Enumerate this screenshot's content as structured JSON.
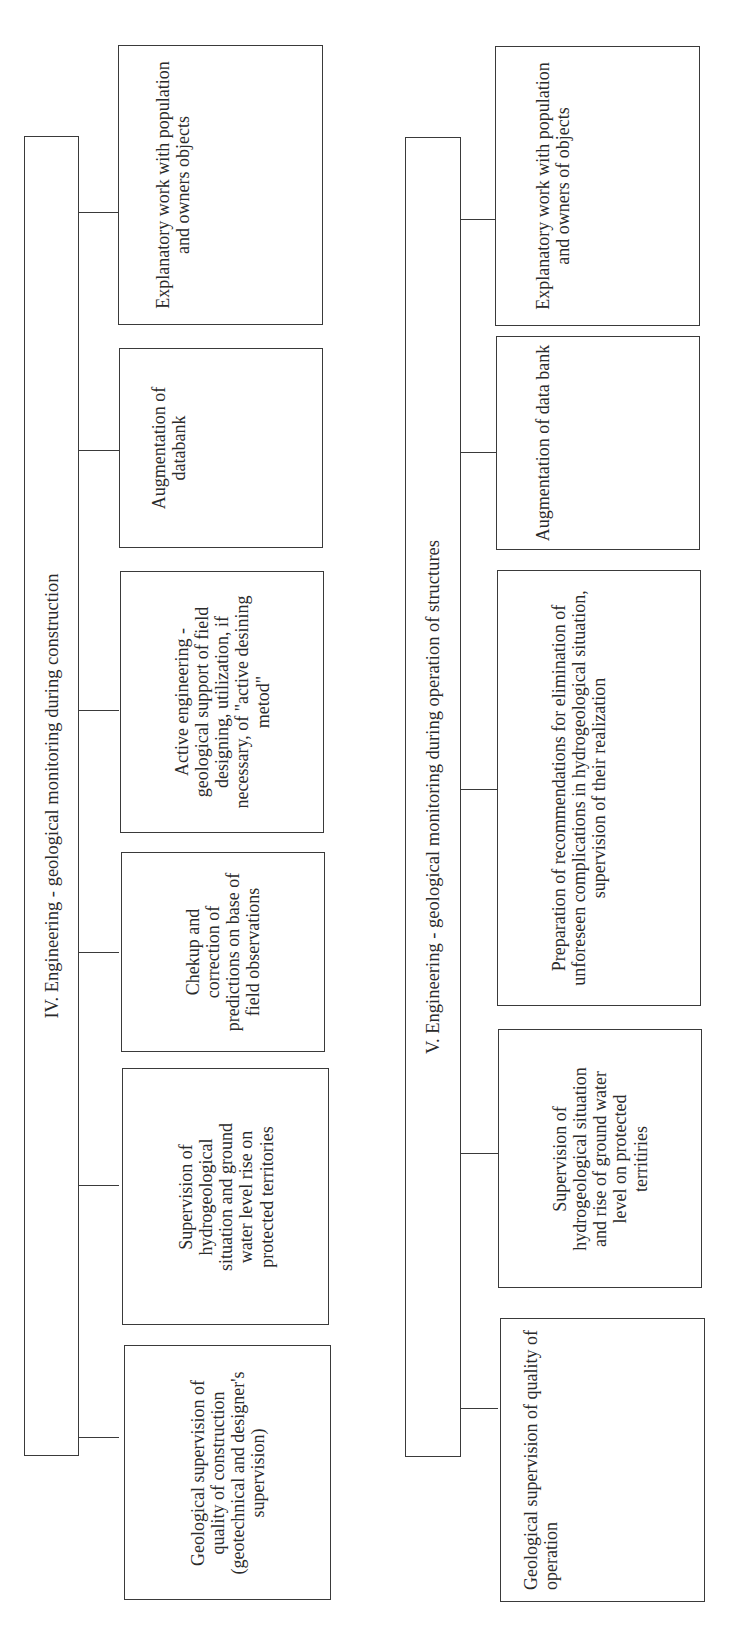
{
  "diagram_iv": {
    "title": "IV. Engineering - geological monitoring during construction",
    "boxes": [
      {
        "label": "Geological supervision of quality of construction (geotechnical and designer's supervision)"
      },
      {
        "label": "Supervision of hydrogeological situation and ground water level rise on protected territories"
      },
      {
        "label": "Chekup and correction of predictions on base of field observations"
      },
      {
        "label": "Active engineering - geological support of field designing, utilization, if necessary, of \"active desining metod\""
      },
      {
        "label": "Augmentation of databank"
      },
      {
        "label": "Explanatory work with population and owners objects"
      }
    ]
  },
  "diagram_v": {
    "title": "V. Engineering - geological monitoring during operation of structures",
    "boxes": [
      {
        "label": "Geological supervision of quality of operation"
      },
      {
        "label": "Supervision of hydrogeological situation and rise of ground water level on protected territiries"
      },
      {
        "label": "Preparation of recommendations for elimination of unforeseen complications in hydrogeological situation, supervision of their realization"
      },
      {
        "label": "Augmentation of data bank"
      },
      {
        "label": "Explanatory work with population and owners of objects"
      }
    ]
  }
}
